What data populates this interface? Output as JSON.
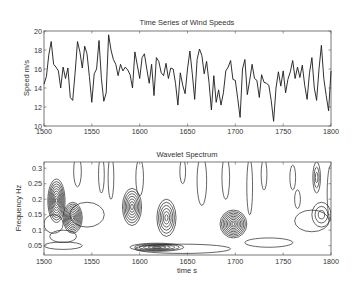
{
  "chart_data": [
    {
      "type": "line",
      "title": "Time Series of Wind Speeds",
      "xlabel": "",
      "ylabel": "Speed  m/s",
      "xlim": [
        1500,
        1800
      ],
      "ylim": [
        10,
        20
      ],
      "xticks": [
        1500,
        1550,
        1600,
        1650,
        1700,
        1750,
        1800
      ],
      "yticks": [
        10,
        12,
        14,
        16,
        18,
        20
      ],
      "grid": false,
      "legend": null,
      "x_start": 1500,
      "x_step": 2.5,
      "values": [
        14.4,
        15.2,
        17.5,
        18.9,
        16.5,
        16.2,
        15.8,
        14.0,
        16.2,
        15.0,
        16.1,
        13.0,
        12.7,
        15.6,
        18.9,
        17.8,
        16.1,
        18.4,
        17.6,
        15.2,
        12.5,
        15.5,
        16.0,
        19.0,
        15.0,
        12.6,
        13.5,
        19.6,
        18.0,
        17.0,
        16.5,
        15.3,
        16.5,
        15.8,
        16.2,
        15.9,
        15.4,
        14.0,
        17.8,
        16.4,
        15.0,
        17.2,
        17.6,
        16.0,
        14.5,
        16.5,
        13.2,
        17.2,
        16.8,
        15.6,
        15.3,
        16.6,
        15.0,
        16.1,
        16.0,
        14.5,
        12.2,
        15.6,
        14.3,
        13.4,
        16.0,
        17.9,
        15.5,
        12.8,
        17.0,
        18.1,
        17.4,
        15.5,
        16.8,
        14.6,
        11.7,
        15.3,
        12.5,
        13.8,
        12.2,
        13.5,
        15.8,
        16.2,
        16.9,
        14.9,
        14.8,
        12.9,
        10.9,
        16.0,
        17.0,
        13.3,
        14.8,
        16.5,
        15.0,
        14.8,
        13.0,
        15.4,
        14.6,
        14.5,
        14.3,
        12.7,
        10.5,
        14.0,
        15.7,
        14.2,
        15.8,
        13.5,
        14.9,
        15.7,
        16.9,
        15.0,
        16.2,
        15.1,
        16.4,
        14.3,
        12.8,
        15.6,
        17.2,
        14.0,
        12.7,
        16.0,
        18.5,
        15.0,
        13.2,
        11.6,
        15.8,
        13.0,
        14.5,
        17.2,
        15.5,
        14.0,
        15.6,
        16.1,
        18.4,
        16.2,
        16.8,
        15.7,
        16.5,
        14.0,
        15.5,
        17.9,
        15.3,
        14.0,
        16.4,
        13.3,
        14.2,
        13.9,
        17.5,
        16.4,
        14.9,
        16.4,
        17.6,
        15.8,
        14.2,
        15.5,
        14.9,
        15.6,
        14.0,
        14.6,
        15.4,
        15.1,
        14.3,
        14.6,
        13.0,
        15.8,
        15.4,
        14.2,
        13.7,
        16.8,
        15.3,
        14.3,
        15.5,
        14.8,
        17.0,
        14.0,
        15.5,
        17.1,
        16.8,
        17.2,
        15.5,
        16.2,
        15.8,
        16.8,
        19.3,
        17.2,
        16.3,
        17.9,
        15.1,
        15.6,
        19.6,
        17.9,
        15.6
      ]
    },
    {
      "type": "contour",
      "title": "Wavelet Spectrum",
      "xlabel": "time  s",
      "ylabel": "Frequency Hz",
      "xlim": [
        1500,
        1800
      ],
      "ylim": [
        0.02,
        0.32
      ],
      "xticks": [
        1500,
        1550,
        1600,
        1650,
        1700,
        1750,
        1800
      ],
      "yticks": [
        0.05,
        0.1,
        0.15,
        0.2,
        0.25,
        0.3
      ],
      "grid": false,
      "peaks": [
        {
          "t": 1513,
          "f": 0.195,
          "levels": 9,
          "rt": 9,
          "rf": 0.07,
          "note": "strong"
        },
        {
          "t": 1530,
          "f": 0.14,
          "levels": 9,
          "rt": 10,
          "rf": 0.05,
          "note": "strong"
        },
        {
          "t": 1592,
          "f": 0.175,
          "levels": 7,
          "rt": 10,
          "rf": 0.06
        },
        {
          "t": 1628,
          "f": 0.14,
          "levels": 6,
          "rt": 10,
          "rf": 0.06
        },
        {
          "t": 1618,
          "f": 0.045,
          "levels": 6,
          "rt": 28,
          "rf": 0.013,
          "note": "strong"
        },
        {
          "t": 1698,
          "f": 0.12,
          "levels": 9,
          "rt": 14,
          "rf": 0.045,
          "note": "strong"
        },
        {
          "t": 1790,
          "f": 0.15,
          "levels": 3,
          "rt": 10,
          "rf": 0.04
        },
        {
          "t": 1785,
          "f": 0.27,
          "levels": 3,
          "rt": 4,
          "rf": 0.05
        }
      ]
    }
  ],
  "colors": {
    "line": "#1a1a1a",
    "frame": "#555555",
    "background": "#ffffff"
  }
}
